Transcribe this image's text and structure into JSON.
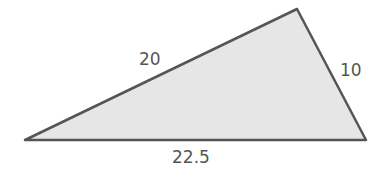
{
  "figure": {
    "type": "triangle",
    "vertices": [
      [
        25,
        140
      ],
      [
        297,
        9
      ],
      [
        366,
        140
      ]
    ],
    "fill_color": "#e6e6e6",
    "stroke_color": "#555555",
    "labels": {
      "left_side": "20",
      "right_side": "10",
      "base": "22.5"
    }
  }
}
